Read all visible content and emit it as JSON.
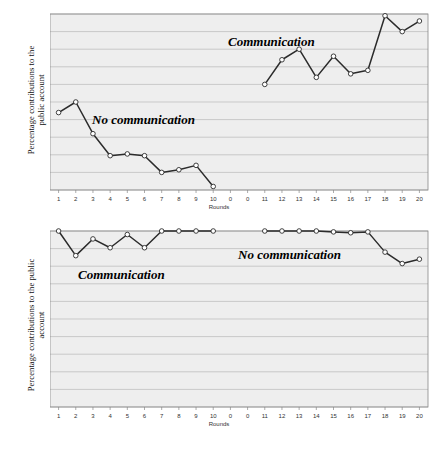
{
  "figure": {
    "background": "#ffffff",
    "plot_background": "#eeeeee",
    "gridline_color": "#b9b9b9",
    "line_color": "#2b2b2b",
    "marker_fill": "#ffffff",
    "marker_stroke": "#2b2b2b",
    "axis_color": "#888888"
  },
  "panels": [
    {
      "id": "top",
      "ylabel_line1": "Percentage contributions to the",
      "ylabel_line2": "public account",
      "xlabel": "Rounds",
      "annotations": [
        {
          "text": "No communication",
          "x": 92,
          "y": 112,
          "size": 13
        },
        {
          "text": "Communication",
          "x": 228,
          "y": 34,
          "size": 13
        }
      ]
    },
    {
      "id": "bottom",
      "ylabel_line1": "Percentage contributions to the public",
      "ylabel_line2": "account",
      "xlabel": "Rounds",
      "annotations": [
        {
          "text": "Communication",
          "x": 78,
          "y": 267,
          "size": 13
        },
        {
          "text": "No communication",
          "x": 238,
          "y": 247,
          "size": 13
        }
      ]
    }
  ],
  "chart_data": [
    {
      "type": "line",
      "id": "top-chart",
      "title": "",
      "xlabel": "Rounds",
      "ylabel": "Percentage contributions to the public account",
      "ylim": [
        0,
        100
      ],
      "yticks": [
        0,
        10,
        20,
        30,
        40,
        50,
        60,
        70,
        80,
        90,
        100
      ],
      "xtick_labels": [
        "1",
        "2",
        "3",
        "4",
        "5",
        "6",
        "7",
        "8",
        "9",
        "10",
        "0",
        "0",
        "11",
        "12",
        "13",
        "14",
        "15",
        "16",
        "17",
        "18",
        "19",
        "20"
      ],
      "grid": true,
      "legend": "none",
      "series": [
        {
          "name": "No communication",
          "x_slots": [
            0,
            1,
            2,
            3,
            4,
            5,
            6,
            7,
            8,
            9
          ],
          "rounds": [
            "1",
            "2",
            "3",
            "4",
            "5",
            "6",
            "7",
            "8",
            "9",
            "10"
          ],
          "values": [
            44,
            50,
            32,
            19.5,
            20.5,
            19.5,
            10,
            11.5,
            14,
            2
          ]
        },
        {
          "name": "Communication",
          "x_slots": [
            12,
            13,
            14,
            15,
            16,
            17,
            18,
            19,
            20,
            21
          ],
          "rounds": [
            "11",
            "12",
            "13",
            "14",
            "15",
            "16",
            "17",
            "18",
            "19",
            "20"
          ],
          "values": [
            60,
            74,
            80,
            64,
            76,
            66,
            68,
            99,
            90,
            96
          ]
        }
      ]
    },
    {
      "type": "line",
      "id": "bottom-chart",
      "title": "",
      "xlabel": "Rounds",
      "ylabel": "Percentage contributions to the public account",
      "ylim": [
        0,
        100
      ],
      "yticks": [
        0,
        10,
        20,
        30,
        40,
        50,
        60,
        70,
        80,
        90,
        100
      ],
      "xtick_labels": [
        "1",
        "2",
        "3",
        "4",
        "5",
        "6",
        "7",
        "8",
        "9",
        "10",
        "0",
        "0",
        "11",
        "12",
        "13",
        "14",
        "15",
        "16",
        "17",
        "18",
        "19",
        "20"
      ],
      "grid": true,
      "legend": "none",
      "series": [
        {
          "name": "Communication",
          "x_slots": [
            0,
            1,
            2,
            3,
            4,
            5,
            6,
            7,
            8,
            9
          ],
          "rounds": [
            "1",
            "2",
            "3",
            "4",
            "5",
            "6",
            "7",
            "8",
            "9",
            "10"
          ],
          "values": [
            100,
            86,
            95.5,
            90.5,
            98,
            90.5,
            100,
            100,
            100,
            100
          ]
        },
        {
          "name": "No communication",
          "x_slots": [
            12,
            13,
            14,
            15,
            16,
            17,
            18,
            19,
            20,
            21
          ],
          "rounds": [
            "11",
            "12",
            "13",
            "14",
            "15",
            "16",
            "17",
            "18",
            "19",
            "20"
          ],
          "values": [
            100,
            100,
            100,
            100,
            99.5,
            99,
            99.5,
            88,
            81.5,
            84
          ]
        }
      ]
    }
  ]
}
